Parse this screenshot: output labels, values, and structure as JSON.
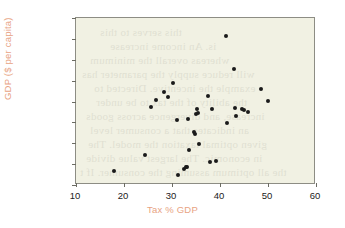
{
  "chart_data": {
    "type": "scatter",
    "title": "",
    "xlabel": "Tax % GDP",
    "ylabel": "GDP ($ per capita)",
    "xlim": [
      10,
      60
    ],
    "ylim": [
      0,
      80000
    ],
    "xticks": [
      10,
      20,
      30,
      40,
      50,
      60
    ],
    "xtick_labels": [
      "10",
      "20",
      "30",
      "40",
      "50",
      "60"
    ],
    "yticks": [
      0,
      10000,
      20000,
      30000,
      40000,
      50000,
      60000,
      70000,
      80000
    ],
    "ytick_labels": [
      "0",
      "10,000",
      "20,000",
      "30,000",
      "40,000",
      "50,000",
      "60,000",
      "70,000",
      "80,000"
    ],
    "grid": false,
    "legend": null,
    "marker": "filled-circle",
    "marker_color": "#1a1a1a",
    "plot_background": "#f1f1e3",
    "axis_label_color": "#e8a383",
    "points": [
      {
        "x": 18.0,
        "y": 6800
      },
      {
        "x": 24.4,
        "y": 14500
      },
      {
        "x": 25.6,
        "y": 37200
      },
      {
        "x": 26.6,
        "y": 40500
      },
      {
        "x": 28.4,
        "y": 44500
      },
      {
        "x": 29.2,
        "y": 42200
      },
      {
        "x": 30.2,
        "y": 48700
      },
      {
        "x": 31.0,
        "y": 31300
      },
      {
        "x": 31.3,
        "y": 4800
      },
      {
        "x": 32.6,
        "y": 7700
      },
      {
        "x": 33.0,
        "y": 8400
      },
      {
        "x": 33.2,
        "y": 8700
      },
      {
        "x": 33.3,
        "y": 31500
      },
      {
        "x": 33.6,
        "y": 16800
      },
      {
        "x": 34.6,
        "y": 25400
      },
      {
        "x": 34.8,
        "y": 24600
      },
      {
        "x": 35.0,
        "y": 33800
      },
      {
        "x": 35.2,
        "y": 36200
      },
      {
        "x": 35.4,
        "y": 34300
      },
      {
        "x": 35.6,
        "y": 19600
      },
      {
        "x": 37.6,
        "y": 42700
      },
      {
        "x": 38.0,
        "y": 11200
      },
      {
        "x": 38.4,
        "y": 36300
      },
      {
        "x": 39.2,
        "y": 11400
      },
      {
        "x": 41.2,
        "y": 71200
      },
      {
        "x": 41.4,
        "y": 29800
      },
      {
        "x": 43.0,
        "y": 55600
      },
      {
        "x": 43.2,
        "y": 37000
      },
      {
        "x": 43.4,
        "y": 33200
      },
      {
        "x": 44.6,
        "y": 36400
      },
      {
        "x": 45.0,
        "y": 35700
      },
      {
        "x": 45.8,
        "y": 35100
      },
      {
        "x": 48.6,
        "y": 45800
      },
      {
        "x": 50.0,
        "y": 40100
      }
    ]
  },
  "bleed_text": [
    {
      "t": "an evidence of which a",
      "x": 28,
      "y": -14
    },
    {
      "t": "this serves to this",
      "x": 24,
      "y": 8
    },
    {
      "t": "is. An income increase",
      "x": 34,
      "y": 22
    },
    {
      "t": "whereas overall the minimum",
      "x": 14,
      "y": 36
    },
    {
      "t": "will reduce supply the parameter has",
      "x": 6,
      "y": 50
    },
    {
      "t": "example the incentive. Directed to",
      "x": 18,
      "y": 64
    },
    {
      "t": "the ability of the tax to be under",
      "x": 20,
      "y": 78
    },
    {
      "t": "increase, and divergence across goods",
      "x": 10,
      "y": 92
    },
    {
      "t": "an indicates that a consumer level",
      "x": 14,
      "y": 106
    },
    {
      "t": "given optimal taxation the model. The",
      "x": 12,
      "y": 120
    },
    {
      "t": "in economic. The largest value divide",
      "x": 10,
      "y": 134
    },
    {
      "t": "the all optimum assuming the consumer. If t",
      "x": 4,
      "y": 148
    },
    {
      "t": "including a labour allocation and produce",
      "x": 8,
      "y": 162
    }
  ]
}
